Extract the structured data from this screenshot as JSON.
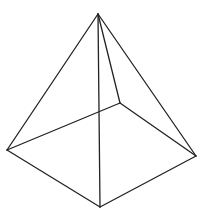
{
  "diagram": {
    "title": "",
    "shape": "square pyramid wireframe",
    "stroke_color": "#222222",
    "background": "#ffffff",
    "vertices": {
      "apex": [
        98,
        14
      ],
      "left": [
        7,
        150
      ],
      "bottom": [
        100,
        207
      ],
      "right": [
        196,
        156
      ],
      "back": [
        120,
        103
      ]
    },
    "edges": [
      {
        "name": "apex-left",
        "from": "apex",
        "to": "left"
      },
      {
        "name": "apex-right",
        "from": "apex",
        "to": "right"
      },
      {
        "name": "apex-bottom",
        "from": "apex",
        "to": "bottom"
      },
      {
        "name": "apex-back",
        "from": "apex",
        "to": "back"
      },
      {
        "name": "left-bottom",
        "from": "left",
        "to": "bottom"
      },
      {
        "name": "bottom-right",
        "from": "bottom",
        "to": "right"
      },
      {
        "name": "right-back",
        "from": "right",
        "to": "back"
      },
      {
        "name": "back-left",
        "from": "back",
        "to": "left"
      }
    ]
  }
}
